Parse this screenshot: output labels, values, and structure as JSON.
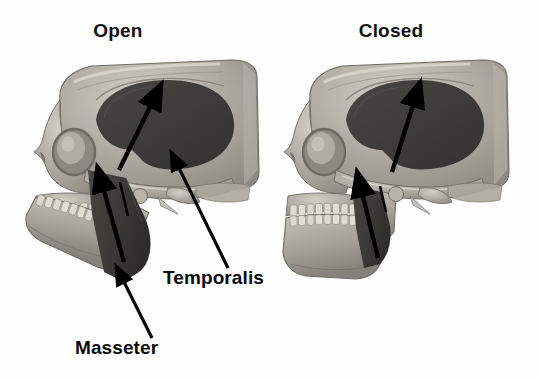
{
  "figure": {
    "title_open": "Open",
    "title_closed": "Closed",
    "label_temporalis": "Temporalis",
    "label_masseter": "Masseter",
    "background_color": "#ffffff",
    "bone_color": "#a8a49c",
    "bone_light": "#cfcbc2",
    "bone_shadow": "#7d7a73",
    "muscle_color": "#3d3c3a",
    "muscle_color_light": "#4a4946",
    "text_color": "#090909",
    "arrow_color": "#000000"
  },
  "panels": [
    {
      "name": "open",
      "title": "Open",
      "jaw_state": "open",
      "muscles": [
        {
          "name": "temporalis",
          "shape": "ellipse",
          "region": "temporal fossa",
          "color": "#3d3c3a"
        },
        {
          "name": "masseter",
          "shape": "band",
          "region": "mandibular ramus",
          "color": "#3d3c3a"
        }
      ],
      "force_arrows": [
        {
          "muscle": "temporalis",
          "direction": "up-right"
        },
        {
          "muscle": "masseter",
          "direction": "up-right"
        }
      ]
    },
    {
      "name": "closed",
      "title": "Closed",
      "jaw_state": "closed",
      "muscles": [
        {
          "name": "temporalis",
          "shape": "ellipse",
          "region": "temporal fossa",
          "color": "#3d3c3a"
        },
        {
          "name": "masseter",
          "shape": "band",
          "region": "mandibular ramus",
          "color": "#3d3c3a"
        }
      ],
      "force_arrows": [
        {
          "muscle": "temporalis",
          "direction": "up-right"
        },
        {
          "muscle": "masseter",
          "direction": "up-right"
        }
      ]
    }
  ],
  "callouts": [
    {
      "label": "Temporalis",
      "points_to": "temporalis muscle in open skull",
      "arrow": "up-left"
    },
    {
      "label": "Masseter",
      "points_to": "masseter muscle in open skull",
      "arrow": "up-left"
    }
  ]
}
